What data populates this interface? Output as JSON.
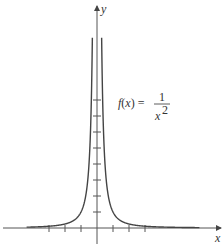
{
  "chart_data": {
    "type": "line",
    "title": "",
    "function": "f(x) = 1/x^2",
    "annotation": {
      "text_lhs": "f(x) =",
      "numerator": "1",
      "denominator": "x",
      "exponent": "2"
    },
    "xlabel": "x",
    "ylabel": "y",
    "xlim": [
      -6,
      7.7
    ],
    "ylim": [
      -1.2,
      13.9
    ],
    "x_ticks": [
      -3,
      -2,
      -1,
      1,
      2,
      3
    ],
    "y_ticks": [
      1,
      2,
      3,
      4,
      5,
      6,
      7,
      8
    ],
    "tick_labels_shown": false,
    "grid": false,
    "legend": null,
    "series": [
      {
        "name": "left branch",
        "domain": [
          -4.4,
          -0.29
        ],
        "color": "#444444"
      },
      {
        "name": "right branch",
        "domain": [
          0.29,
          6.4
        ],
        "color": "#444444"
      }
    ],
    "sample_points": [
      {
        "x": -4,
        "y": 0.0625
      },
      {
        "x": -3,
        "y": 0.111
      },
      {
        "x": -2,
        "y": 0.25
      },
      {
        "x": -1,
        "y": 1
      },
      {
        "x": -0.5,
        "y": 4
      },
      {
        "x": -0.35,
        "y": 8.16
      },
      {
        "x": -0.29,
        "y": 11.9
      },
      {
        "x": 0.29,
        "y": 11.9
      },
      {
        "x": 0.35,
        "y": 8.16
      },
      {
        "x": 0.5,
        "y": 4
      },
      {
        "x": 1,
        "y": 1
      },
      {
        "x": 2,
        "y": 0.25
      },
      {
        "x": 3,
        "y": 0.111
      },
      {
        "x": 4,
        "y": 0.0625
      },
      {
        "x": 6,
        "y": 0.028
      }
    ]
  },
  "layout": {
    "origin_px": [
      97,
      228
    ],
    "px_per_unit": 16
  }
}
